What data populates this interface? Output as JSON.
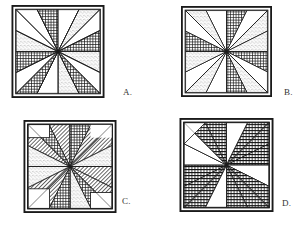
{
  "page": {
    "background_color": "#ffffff",
    "ink_color": "#222222"
  },
  "options": [
    {
      "id": "A",
      "label": "A.",
      "block_name": "eight-point-star-pinwheel-crosshatch-stipple",
      "description": "Eight pointed star with alternating dark crosshatch and light stipple rays, white corner triangles",
      "fills": [
        "crosshatch",
        "stipple",
        "white"
      ]
    },
    {
      "id": "B",
      "label": "B.",
      "block_name": "eight-point-star-pinwheel-offset-crosshatch-stipple",
      "description": "Eight pointed star, rays rotated so stipple and crosshatch swap position relative to A",
      "fills": [
        "crosshatch",
        "stipple",
        "white"
      ]
    },
    {
      "id": "C",
      "label": "C.",
      "block_name": "eight-point-star-pinwheel-diagonal-hatch",
      "description": "Eight pointed star with diagonal line hatch corners, crosshatch and stipple rays, white squares",
      "fills": [
        "diagonal-hatch",
        "crosshatch",
        "stipple",
        "white"
      ]
    },
    {
      "id": "D",
      "label": "D.",
      "block_name": "eight-point-star-pinwheel-all-crosshatch",
      "description": "Eight pointed star with all rays dark crosshatch, white corner triangles",
      "fills": [
        "crosshatch",
        "white"
      ]
    }
  ],
  "legend": {
    "pattern_names": {
      "crosshatch": "dark crosshatch fill",
      "stipple": "light dotted stipple fill",
      "diagonal_hatch": "diagonal line hatch fill",
      "white": "plain white fill"
    }
  }
}
